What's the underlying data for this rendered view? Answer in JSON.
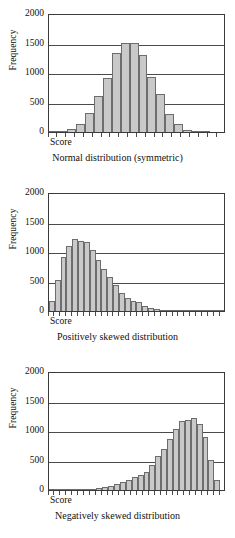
{
  "figure": {
    "axis_title_y": "Frequency",
    "axis_label_x": "Score",
    "y_ticks": [
      "2000",
      "1500",
      "1000",
      "500",
      "0"
    ]
  },
  "panels": [
    {
      "caption": "Normal distribution (symmetric)",
      "x_label": "Score",
      "y_title": "Frequency"
    },
    {
      "caption": "Positively skewed distribution",
      "x_label": "Score",
      "y_title": "Frequency"
    },
    {
      "caption": "Negatively skewed distribution",
      "x_label": "Score",
      "y_title": "Frequency"
    }
  ],
  "chart_data": [
    {
      "type": "bar",
      "title": "Normal distribution (symmetric)",
      "xlabel": "Score",
      "ylabel": "Frequency",
      "ylim": [
        0,
        2000
      ],
      "yticks": [
        0,
        500,
        1000,
        1500,
        2000
      ],
      "grid": true,
      "legend": "none",
      "categories": [
        "1",
        "2",
        "3",
        "4",
        "5",
        "6",
        "7",
        "8",
        "9",
        "10",
        "11",
        "12",
        "13",
        "14",
        "15",
        "16",
        "17",
        "18",
        "19",
        "20"
      ],
      "values": [
        5,
        15,
        60,
        135,
        330,
        620,
        930,
        1355,
        1520,
        1530,
        1325,
        935,
        650,
        315,
        130,
        40,
        12,
        5,
        0,
        0
      ]
    },
    {
      "type": "bar",
      "title": "Positively skewed distribution",
      "xlabel": "Score",
      "ylabel": "Frequency",
      "ylim": [
        0,
        2000
      ],
      "yticks": [
        0,
        500,
        1000,
        1500,
        2000
      ],
      "grid": true,
      "legend": "none",
      "categories": [
        "1",
        "2",
        "3",
        "4",
        "5",
        "6",
        "7",
        "8",
        "9",
        "10",
        "11",
        "12",
        "13",
        "14",
        "15",
        "16",
        "17",
        "18",
        "19",
        "20",
        "21",
        "22",
        "23",
        "24",
        "25",
        "26",
        "27",
        "28",
        "29",
        "30"
      ],
      "values": [
        170,
        530,
        920,
        1115,
        1225,
        1195,
        1185,
        1040,
        870,
        710,
        585,
        450,
        300,
        230,
        170,
        155,
        90,
        55,
        40,
        25,
        18,
        12,
        8,
        6,
        5,
        4,
        3,
        2,
        2,
        1
      ]
    },
    {
      "type": "bar",
      "title": "Negatively skewed distribution",
      "xlabel": "Score",
      "ylabel": "Frequency",
      "ylim": [
        0,
        2000
      ],
      "yticks": [
        0,
        500,
        1000,
        1500,
        2000
      ],
      "grid": true,
      "legend": "none",
      "categories": [
        "1",
        "2",
        "3",
        "4",
        "5",
        "6",
        "7",
        "8",
        "9",
        "10",
        "11",
        "12",
        "13",
        "14",
        "15",
        "16",
        "17",
        "18",
        "19",
        "20",
        "21",
        "22",
        "23",
        "24",
        "25",
        "26",
        "27",
        "28",
        "29",
        "30"
      ],
      "values": [
        1,
        2,
        2,
        3,
        4,
        6,
        10,
        18,
        28,
        45,
        70,
        100,
        140,
        175,
        215,
        250,
        300,
        435,
        585,
        700,
        865,
        1040,
        1185,
        1205,
        1225,
        1130,
        910,
        520,
        165,
        0
      ]
    }
  ]
}
